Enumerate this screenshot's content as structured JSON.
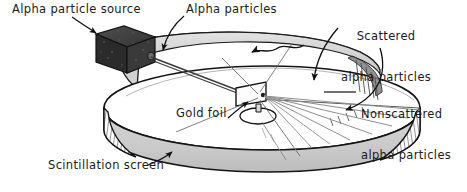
{
  "figure": {
    "width": 467,
    "height": 192,
    "background_color": "#ffffff"
  },
  "labels": {
    "alpha_particle_source": "Alpha particle source",
    "alpha_particles": "Alpha particles",
    "scattered_line1": "Scattered",
    "scattered_line2": "alpha particles",
    "nonscattered_line1": "Nonscattered",
    "nonscattered_line2": "alpha particles",
    "gold_foil": "Gold foil",
    "scintillation_screen": "Scintillation screen"
  },
  "parts": {
    "source_box": "alpha-particle-source-box",
    "screen_ring": "scintillation-screen-ring",
    "gold_foil_target": "gold-foil-target",
    "beam": "incident-alpha-beam",
    "scattered_rays": "scattered-alpha-rays",
    "nonscattered_rays": "nonscattered-alpha-rays"
  },
  "colors": {
    "ink": "#1a1a1a",
    "source_box_dark": "#2b2b2b",
    "source_box_mid": "#3d3d3d",
    "source_box_light": "#545454",
    "ring_inner_gray": "#b8b8b8",
    "ring_front_gray": "#cfcfcf",
    "ring_back_gray": "#d8d8d8",
    "foil_white": "#fdfdfd",
    "ray_gray": "#8c8c8c",
    "background": "#ffffff"
  }
}
